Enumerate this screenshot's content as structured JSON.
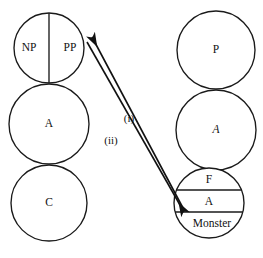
{
  "diagram": {
    "colors": {
      "stroke": "#1a1a1a",
      "text": "#111111",
      "background": "#ffffff"
    },
    "left_tree": {
      "name": "left-tree",
      "nodes": [
        {
          "id": "left-top",
          "kind": "split-circle-vertical",
          "left_label": "NP",
          "right_label": "PP",
          "cx": 49,
          "cy": 48,
          "r": 35
        },
        {
          "id": "left-middle",
          "kind": "circle",
          "label": "A",
          "cx": 49,
          "cy": 124,
          "r": 40
        },
        {
          "id": "left-bottom",
          "kind": "circle",
          "label": "C",
          "cx": 49,
          "cy": 203,
          "r": 38
        }
      ]
    },
    "right_tree": {
      "name": "right-tree",
      "nodes": [
        {
          "id": "right-top",
          "kind": "circle",
          "label": "P",
          "cx": 216,
          "cy": 50,
          "r": 39
        },
        {
          "id": "right-middle",
          "kind": "circle",
          "label": "A",
          "cx": 216,
          "cy": 130,
          "r": 40
        },
        {
          "id": "right-bottom",
          "kind": "banded-circle",
          "cx": 209,
          "cy": 203,
          "r": 35,
          "bands": [
            {
              "label": "F",
              "y": 183
            },
            {
              "label": "A",
              "y": 203
            },
            {
              "label": "Monster",
              "y": 221
            }
          ]
        }
      ]
    },
    "edges": [
      {
        "id": "edge-i",
        "label": "(i)",
        "label_x": 129,
        "label_y": 119,
        "from": {
          "x": 183,
          "y": 208
        },
        "to": {
          "x": 90,
          "y": 38
        },
        "arrow_at": "to"
      },
      {
        "id": "edge-ii",
        "label": "(ii)",
        "label_x": 111,
        "label_y": 141,
        "from": {
          "x": 88,
          "y": 41
        },
        "to": {
          "x": 186,
          "y": 214
        },
        "arrow_at": "to"
      }
    ]
  }
}
